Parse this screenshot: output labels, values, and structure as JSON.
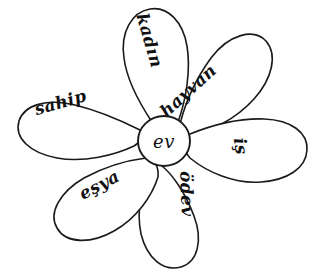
{
  "diagram": {
    "type": "word-web",
    "style": {
      "background_color": "#ffffff",
      "stroke_color": "#1a1a1a",
      "fill_color": "#ffffff",
      "text_color": "#111111"
    },
    "center": {
      "label": "ev",
      "cx": 164,
      "cy": 141,
      "rx": 26,
      "ry": 25
    },
    "petals": [
      {
        "id": "kadin",
        "label": "kadın",
        "position": "top-left-upper",
        "angle_deg": -68,
        "text_rotate_deg": 74,
        "text_x": 144,
        "text_y": 42,
        "path": "M 152 122 C 140 104 127 82 124 58 C 120 32 132 12 150 9 C 168 6 183 22 187 46 C 191 70 186 100 178 122 C 170 132 160 132 152 122 Z"
      },
      {
        "id": "hayvan",
        "label": "hayvan",
        "position": "top-right-upper",
        "angle_deg": -28,
        "text_rotate_deg": -42,
        "text_x": 192,
        "text_y": 95,
        "path": "M 180 124 C 185 104 195 80 211 58 C 229 34 254 28 266 41 C 278 55 272 79 254 99 C 236 119 210 132 189 136 C 178 136 175 132 180 124 Z"
      },
      {
        "id": "is",
        "label": "iş",
        "position": "right",
        "angle_deg": 10,
        "text_rotate_deg": 82,
        "text_x": 235,
        "text_y": 147,
        "path": "M 190 134 C 210 126 238 118 264 119 C 292 120 308 133 307 150 C 306 168 288 180 261 182 C 234 184 207 172 190 158 C 183 150 183 140 190 134 Z"
      },
      {
        "id": "odev",
        "label": "ödev",
        "position": "bottom",
        "angle_deg": 82,
        "text_rotate_deg": 88,
        "text_x": 181,
        "text_y": 194,
        "path": "M 162 166 C 172 174 185 192 194 216 C 203 240 198 262 181 267 C 163 272 147 258 141 234 C 136 210 142 184 150 168 C 155 161 158 161 162 166 Z"
      },
      {
        "id": "esya",
        "label": "eşya",
        "position": "bottom-left",
        "angle_deg": 150,
        "text_rotate_deg": -28,
        "text_x": 102,
        "text_y": 190,
        "path": "M 146 158 C 130 160 106 166 84 178 C 60 192 48 213 57 228 C 66 244 91 244 114 231 C 137 218 152 196 158 177 C 159 167 154 157 146 158 Z"
      },
      {
        "id": "sahip",
        "label": "sahip",
        "position": "left",
        "angle_deg": 192,
        "text_rotate_deg": -16,
        "text_x": 62,
        "text_y": 108,
        "path": "M 140 130 C 124 122 100 111 75 105 C 47 98 24 105 19 121 C 14 138 30 153 57 158 C 84 163 115 155 134 146 C 142 141 145 134 140 130 Z"
      }
    ]
  }
}
